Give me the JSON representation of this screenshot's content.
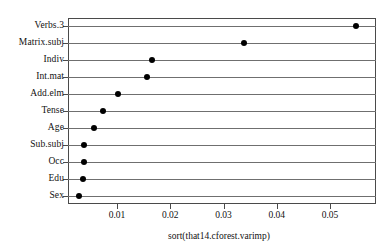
{
  "chart_data": {
    "type": "scatter",
    "title": "",
    "subtitle": "",
    "xlabel": "sort(that14.cforest.varimp)",
    "ylabel": "",
    "orientation": "horizontal",
    "grid": "horizontal-rules-per-category",
    "legend": "none",
    "xlim": [
      0.0028,
      0.0588
    ],
    "xticks": [
      "0.01",
      "0.02",
      "0.03",
      "0.04",
      "0.05"
    ],
    "xtick_values": [
      0.01,
      0.02,
      0.03,
      0.04,
      0.05
    ],
    "categories": [
      "Verbs.3",
      "Matrix.subj",
      "Indiv",
      "Int.mat",
      "Add.elm",
      "Tense",
      "Age",
      "Sub.subj",
      "Occ",
      "Edu",
      "Sex"
    ],
    "values": [
      0.0549,
      0.0338,
      0.0166,
      0.0156,
      0.0101,
      0.0073,
      0.0056,
      0.0038,
      0.0038,
      0.0036,
      0.0029
    ],
    "point_color": "#000000",
    "rule_color": "#6f6f6f",
    "frame_color": "#4a4a4a",
    "background_color": "#ffffff"
  }
}
